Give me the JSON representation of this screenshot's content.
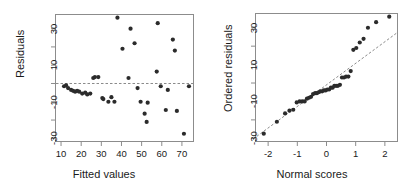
{
  "figure": {
    "background": "#ffffff",
    "point_color": "#2b2b2b",
    "axis_color": "#8c8c8c",
    "refline_color": "#8a8a8a"
  },
  "chart_data": [
    {
      "type": "scatter",
      "panel": "left",
      "title": "",
      "xlabel": "Fitted values",
      "ylabel": "Residuals",
      "xlim": [
        7,
        76
      ],
      "ylim": [
        -32,
        38
      ],
      "xticks": [
        10,
        20,
        30,
        40,
        50,
        60,
        70
      ],
      "xticklabels": [
        "10",
        "20",
        "30",
        "40",
        "50",
        "60",
        "70"
      ],
      "yticks": [
        -30,
        -10,
        10,
        30
      ],
      "yticklabels": [
        "-30",
        "-10",
        "10",
        "30"
      ],
      "yminorticks": [
        -20,
        0,
        20
      ],
      "grid": false,
      "legend": null,
      "annotations": [
        {
          "kind": "hline",
          "y": 0,
          "style": "dashed",
          "label": "zero-residual reference line"
        }
      ],
      "x": [
        11.5,
        12.5,
        13.5,
        15.0,
        16.0,
        17.0,
        18.0,
        19.0,
        20.5,
        22.0,
        23.0,
        24.5,
        26.0,
        26.8,
        28.5,
        30.5,
        31.0,
        33.5,
        35.0,
        36.5,
        38.0,
        40.5,
        43.5,
        44.5,
        46.5,
        48.0,
        49.5,
        51.5,
        52.5,
        53.0,
        57.5,
        58.0,
        59.5,
        62.0,
        63.0,
        65.5,
        66.5,
        67.5,
        71.0,
        73.5
      ],
      "y": [
        -1.5,
        -1.0,
        -2.5,
        -3.5,
        -4.0,
        -4.5,
        -4.0,
        -4.5,
        -5.5,
        -5.0,
        -6.0,
        -5.5,
        3.0,
        3.5,
        3.5,
        -8.0,
        -8.5,
        -10.0,
        -7.5,
        -10.0,
        36.0,
        19.0,
        3.0,
        30.0,
        22.0,
        -2.5,
        -10.0,
        -16.5,
        -21.0,
        -10.5,
        6.5,
        33.0,
        -1.5,
        -14.5,
        -3.5,
        24.0,
        18.0,
        -15.0,
        -27.5,
        -1.5
      ]
    },
    {
      "type": "scatter",
      "panel": "right",
      "title": "",
      "xlabel": "Normal scores",
      "ylabel": "Ordered residuals",
      "xlim": [
        -2.45,
        2.45
      ],
      "ylim": [
        -32,
        38
      ],
      "xticks": [
        -2,
        -1,
        0,
        1,
        2
      ],
      "xticklabels": [
        "-2",
        "-1",
        "0",
        "1",
        "2"
      ],
      "yticks": [
        -30,
        -10,
        10,
        30
      ],
      "yticklabels": [
        "-30",
        "-10",
        "10",
        "30"
      ],
      "yminorticks": [
        -20,
        0,
        20
      ],
      "grid": false,
      "legend": null,
      "annotations": [
        {
          "kind": "qqline",
          "style": "dashed",
          "label": "normal reference line"
        }
      ],
      "x": [
        -2.15,
        -1.7,
        -1.42,
        -1.27,
        -1.14,
        -1.02,
        -0.92,
        -0.83,
        -0.75,
        -0.67,
        -0.6,
        -0.53,
        -0.46,
        -0.39,
        -0.33,
        -0.27,
        -0.21,
        -0.15,
        -0.09,
        -0.03,
        0.03,
        0.09,
        0.15,
        0.21,
        0.27,
        0.33,
        0.39,
        0.46,
        0.53,
        0.6,
        0.67,
        0.75,
        0.83,
        0.92,
        1.02,
        1.14,
        1.27,
        1.42,
        1.7,
        2.15
      ],
      "y": [
        -27.5,
        -21.0,
        -16.5,
        -15.0,
        -14.5,
        -10.5,
        -10.0,
        -10.0,
        -10.0,
        -8.5,
        -8.0,
        -7.5,
        -6.0,
        -5.5,
        -5.5,
        -5.0,
        -4.5,
        -4.5,
        -4.0,
        -4.0,
        -3.5,
        -3.5,
        -2.5,
        -2.5,
        -1.5,
        -1.5,
        -1.5,
        -1.0,
        3.0,
        3.0,
        3.5,
        3.5,
        6.5,
        18.0,
        19.0,
        22.0,
        24.0,
        30.0,
        33.0,
        36.0
      ],
      "refline": {
        "slope": 11.7,
        "intercept": -1.0
      }
    }
  ]
}
